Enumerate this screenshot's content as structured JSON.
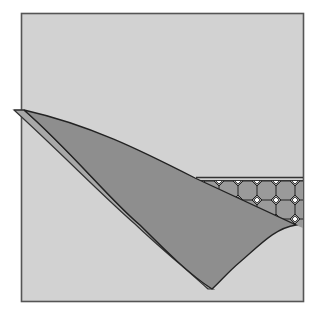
{
  "diagram": {
    "title": "Folded flap over square with patterned band",
    "colors": {
      "background": "#ffffff",
      "paper": "#d2d2d2",
      "flap": "#8e8e8e",
      "pattern_fill": "#9a9a9a",
      "line": "#333333",
      "highlight": "#ffffff"
    },
    "elements": [
      {
        "name": "square-sheet",
        "shape": "square"
      },
      {
        "name": "folded-flap",
        "shape": "curved-triangle"
      },
      {
        "name": "octagon-pattern-band",
        "shape": "tessellation"
      }
    ]
  }
}
